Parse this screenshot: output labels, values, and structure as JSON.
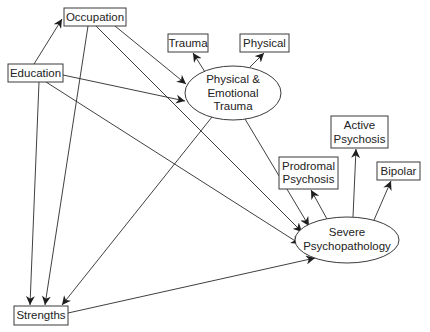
{
  "diagram": {
    "type": "path-model",
    "colors": {
      "stroke": "#3a3a3a",
      "text": "#222222",
      "background": "#ffffff"
    },
    "nodes": {
      "occupation": {
        "label": "Occupation",
        "shape": "box",
        "x": 64,
        "y": 8,
        "w": 62,
        "h": 18
      },
      "education": {
        "label": "Education",
        "shape": "box",
        "x": 8,
        "y": 64,
        "w": 55,
        "h": 18
      },
      "trauma": {
        "label": "Trauma",
        "shape": "box",
        "x": 168,
        "y": 34,
        "w": 40,
        "h": 18
      },
      "physical": {
        "label": "Physical",
        "shape": "box",
        "x": 240,
        "y": 34,
        "w": 49,
        "h": 18
      },
      "pe_trauma": {
        "label_lines": [
          "Physical &",
          "Emotional",
          "Trauma"
        ],
        "shape": "ellipse",
        "cx": 233,
        "cy": 93,
        "rx": 48,
        "ry": 27
      },
      "active_psychosis": {
        "label_lines": [
          "Active",
          "Psychosis"
        ],
        "shape": "box",
        "x": 331,
        "y": 116,
        "w": 57,
        "h": 32
      },
      "prodromal_psychosis": {
        "label_lines": [
          "Prodromal",
          "Psychosis"
        ],
        "shape": "box",
        "x": 279,
        "y": 157,
        "w": 59,
        "h": 32
      },
      "bipolar": {
        "label": "Bipolar",
        "shape": "box",
        "x": 377,
        "y": 162,
        "w": 43,
        "h": 18
      },
      "severe_psychopathology": {
        "label_lines": [
          "Severe",
          "Psychopathology"
        ],
        "shape": "ellipse",
        "cx": 347,
        "cy": 240,
        "rx": 52,
        "ry": 23
      },
      "strengths": {
        "label": "Strengths",
        "shape": "box",
        "x": 14,
        "y": 306,
        "w": 54,
        "h": 19
      }
    },
    "edges": [
      {
        "from": "education",
        "to": "occupation"
      },
      {
        "from": "occupation",
        "to": "pe_trauma"
      },
      {
        "from": "occupation",
        "to": "severe_psychopathology"
      },
      {
        "from": "occupation",
        "to": "strengths"
      },
      {
        "from": "education",
        "to": "pe_trauma"
      },
      {
        "from": "education",
        "to": "severe_psychopathology"
      },
      {
        "from": "education",
        "to": "strengths"
      },
      {
        "from": "pe_trauma",
        "to": "trauma"
      },
      {
        "from": "pe_trauma",
        "to": "physical"
      },
      {
        "from": "pe_trauma",
        "to": "severe_psychopathology"
      },
      {
        "from": "pe_trauma",
        "to": "strengths"
      },
      {
        "from": "strengths",
        "to": "severe_psychopathology"
      },
      {
        "from": "severe_psychopathology",
        "to": "prodromal_psychosis"
      },
      {
        "from": "severe_psychopathology",
        "to": "active_psychosis"
      },
      {
        "from": "severe_psychopathology",
        "to": "bipolar"
      }
    ]
  }
}
